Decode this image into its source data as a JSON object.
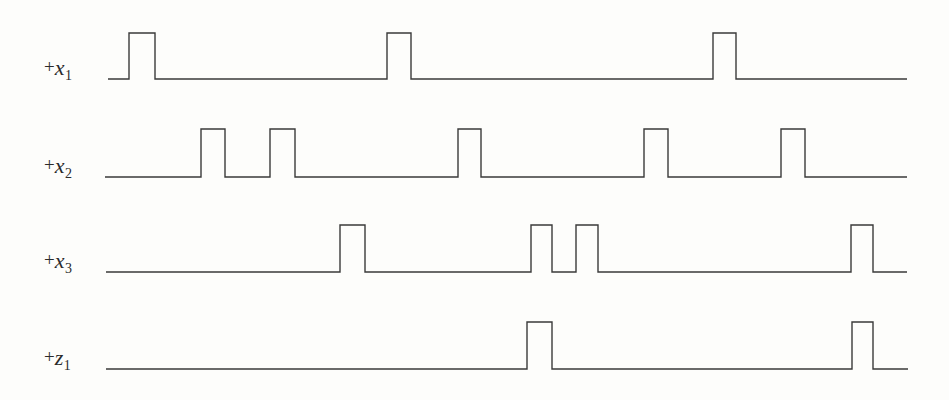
{
  "figure": {
    "type": "timing-diagram",
    "background_color": "#fdfdfb",
    "line_color": "#3a3a3a",
    "line_width": 1.4,
    "width": 949,
    "height": 400
  },
  "traces": [
    {
      "name": "trace-x1",
      "label_plus": "+",
      "label_var": "x",
      "label_sub": "1",
      "label_x": 44,
      "label_y": 70,
      "baseline_y": 79,
      "high_y": 33,
      "x_start": 108,
      "x_end": 907,
      "pulses": [
        {
          "rise": 129,
          "fall": 155
        },
        {
          "rise": 387,
          "fall": 411
        },
        {
          "rise": 713,
          "fall": 736
        }
      ]
    },
    {
      "name": "trace-x2",
      "label_plus": "+",
      "label_var": "x",
      "label_sub": "2",
      "label_x": 44,
      "label_y": 168,
      "baseline_y": 177,
      "high_y": 129,
      "x_start": 105,
      "x_end": 907,
      "pulses": [
        {
          "rise": 201,
          "fall": 225
        },
        {
          "rise": 270,
          "fall": 295
        },
        {
          "rise": 458,
          "fall": 481
        },
        {
          "rise": 644,
          "fall": 668
        },
        {
          "rise": 781,
          "fall": 805
        }
      ]
    },
    {
      "name": "trace-x3",
      "label_plus": "+",
      "label_var": "x",
      "label_sub": "3",
      "label_x": 44,
      "label_y": 263,
      "baseline_y": 272,
      "high_y": 225,
      "x_start": 106,
      "x_end": 907,
      "pulses": [
        {
          "rise": 340,
          "fall": 365
        },
        {
          "rise": 531,
          "fall": 552
        },
        {
          "rise": 576,
          "fall": 598
        },
        {
          "rise": 851,
          "fall": 873
        }
      ]
    },
    {
      "name": "trace-z1",
      "label_plus": "+",
      "label_var": "z",
      "label_sub": "1",
      "label_x": 44,
      "label_y": 360,
      "baseline_y": 369,
      "high_y": 322,
      "x_start": 106,
      "x_end": 908,
      "pulses": [
        {
          "rise": 527,
          "fall": 552
        },
        {
          "rise": 852,
          "fall": 873
        }
      ]
    }
  ],
  "chart_data": {
    "type": "line",
    "title": "",
    "xlabel": "",
    "ylabel": "",
    "series": [
      {
        "name": "+x1",
        "pulse_count": 3,
        "pulse_intervals_px": [
          [
            129,
            155
          ],
          [
            387,
            411
          ],
          [
            713,
            736
          ]
        ]
      },
      {
        "name": "+x2",
        "pulse_count": 5,
        "pulse_intervals_px": [
          [
            201,
            225
          ],
          [
            270,
            295
          ],
          [
            458,
            481
          ],
          [
            644,
            668
          ],
          [
            781,
            805
          ]
        ]
      },
      {
        "name": "+x3",
        "pulse_count": 4,
        "pulse_intervals_px": [
          [
            340,
            365
          ],
          [
            531,
            552
          ],
          [
            576,
            598
          ],
          [
            851,
            873
          ]
        ]
      },
      {
        "name": "+z1",
        "pulse_count": 2,
        "pulse_intervals_px": [
          [
            527,
            552
          ],
          [
            852,
            873
          ]
        ]
      }
    ],
    "legend_position": "left-labels",
    "grid": false
  }
}
